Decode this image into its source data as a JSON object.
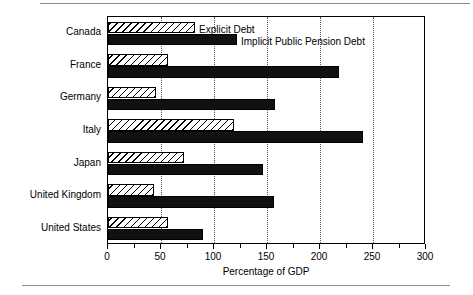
{
  "figure": {
    "name": "explicit-and-implicit-debt-bar-chart",
    "xaxis_title": "Percentage of GDP"
  },
  "legend": {
    "explicit_label": "Explicit Debt",
    "implicit_label": "Implicit Public Pension Debt"
  },
  "axis": {
    "tick_labels": [
      "0",
      "50",
      "100",
      "150",
      "200",
      "250",
      "300"
    ],
    "tick_values": [
      0,
      50,
      100,
      150,
      200,
      250,
      300
    ]
  },
  "chart_data": {
    "type": "bar",
    "orientation": "horizontal",
    "title": "",
    "xlabel": "Percentage of GDP",
    "ylabel": "",
    "xlim": [
      0,
      300
    ],
    "grid": true,
    "legend_position": "inside-top",
    "categories": [
      "Canada",
      "France",
      "Germany",
      "Italy",
      "Japan",
      "United Kingdom",
      "United States"
    ],
    "series": [
      {
        "name": "Explicit Debt",
        "style": "hatched",
        "color": "#ffffff",
        "values": [
          82,
          57,
          45,
          119,
          72,
          43,
          57
        ]
      },
      {
        "name": "Implicit Public Pension Debt",
        "style": "solid",
        "color": "#111111",
        "values": [
          122,
          218,
          158,
          241,
          146,
          157,
          90
        ]
      }
    ]
  }
}
